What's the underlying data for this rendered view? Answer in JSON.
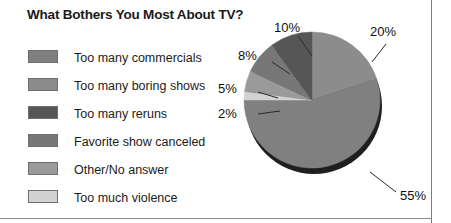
{
  "chart_title": "What Bothers You Most About TV?",
  "legend": {
    "items": [
      {
        "label": "Too many commercials",
        "color": "#808080"
      },
      {
        "label": "Too many boring shows",
        "color": "#8c8c8c"
      },
      {
        "label": "Too many reruns",
        "color": "#565656"
      },
      {
        "label": "Favorite show canceled",
        "color": "#777777"
      },
      {
        "label": "Other/No answer",
        "color": "#9a9a9a"
      },
      {
        "label": "Too much violence",
        "color": "#d2d2d2"
      }
    ]
  },
  "chart_data": {
    "type": "pie",
    "title": "What Bothers You Most About TV?",
    "legend_position": "left",
    "labels": [
      "Too many commercials",
      "Too many boring shows",
      "Too many reruns",
      "Favorite show canceled",
      "Other/No answer",
      "Too much violence"
    ],
    "values": [
      55,
      20,
      10,
      8,
      5,
      2
    ],
    "slices": [
      {
        "name": "Too many boring shows",
        "value": 20,
        "display": "20%",
        "color": "#8c8c8c"
      },
      {
        "name": "Too many commercials",
        "value": 55,
        "display": "55%",
        "color": "#808080"
      },
      {
        "name": "Too much violence",
        "value": 2,
        "display": "2%",
        "color": "#d2d2d2"
      },
      {
        "name": "Other/No answer",
        "value": 5,
        "display": "5%",
        "color": "#9a9a9a"
      },
      {
        "name": "Favorite show canceled",
        "value": 8,
        "display": "8%",
        "color": "#777777"
      },
      {
        "name": "Too many reruns",
        "value": 10,
        "display": "10%",
        "color": "#565656"
      }
    ],
    "data_labels": [
      "20%",
      "55%",
      "2%",
      "5%",
      "8%",
      "10%"
    ],
    "units": "percent",
    "total": 100
  },
  "pie_labels": {
    "p20": "20%",
    "p55": "55%",
    "p2": "2%",
    "p5": "5%",
    "p8": "8%",
    "p10": "10%"
  }
}
